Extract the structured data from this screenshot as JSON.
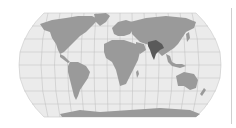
{
  "map": {
    "title": "World map with India highlighted",
    "projection": "Robinson",
    "highlighted_region": "India",
    "colors": {
      "ocean": "#ebebeb",
      "land": "#9a9a9a",
      "highlight": "#5a5a5a",
      "graticule": "#b8b8b8",
      "background": "#ffffff",
      "divider": "#cfcfcf"
    }
  }
}
